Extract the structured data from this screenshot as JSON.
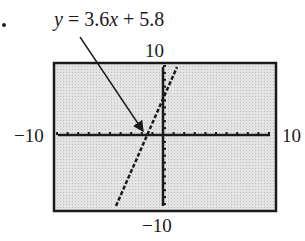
{
  "equation": {
    "prefix": "y",
    "rest": " = 3.6",
    "var": "x",
    "tail": " + 5.8"
  },
  "window": {
    "xmin_label": "−10",
    "xmax_label": "10",
    "ymin_label": "−10",
    "ymax_label": "10"
  },
  "colors": {
    "screen": "#d9d9d9",
    "ink": "#1a1a1a"
  },
  "chart_data": {
    "type": "line",
    "title": "y = 3.6x + 5.8",
    "series": [
      {
        "name": "y = 3.6x + 5.8",
        "x": [
          -4.39,
          -1.61,
          0,
          1.17
        ],
        "y": [
          -10,
          0,
          5.8,
          10
        ]
      }
    ],
    "xlim": [
      -10,
      10
    ],
    "ylim": [
      -10,
      10
    ],
    "xscale": 1,
    "yscale": 1,
    "annotations": [
      {
        "text": "y = 3.6x + 5.8",
        "arrow_to": [
          -1.61,
          0
        ]
      }
    ],
    "grid": false
  }
}
